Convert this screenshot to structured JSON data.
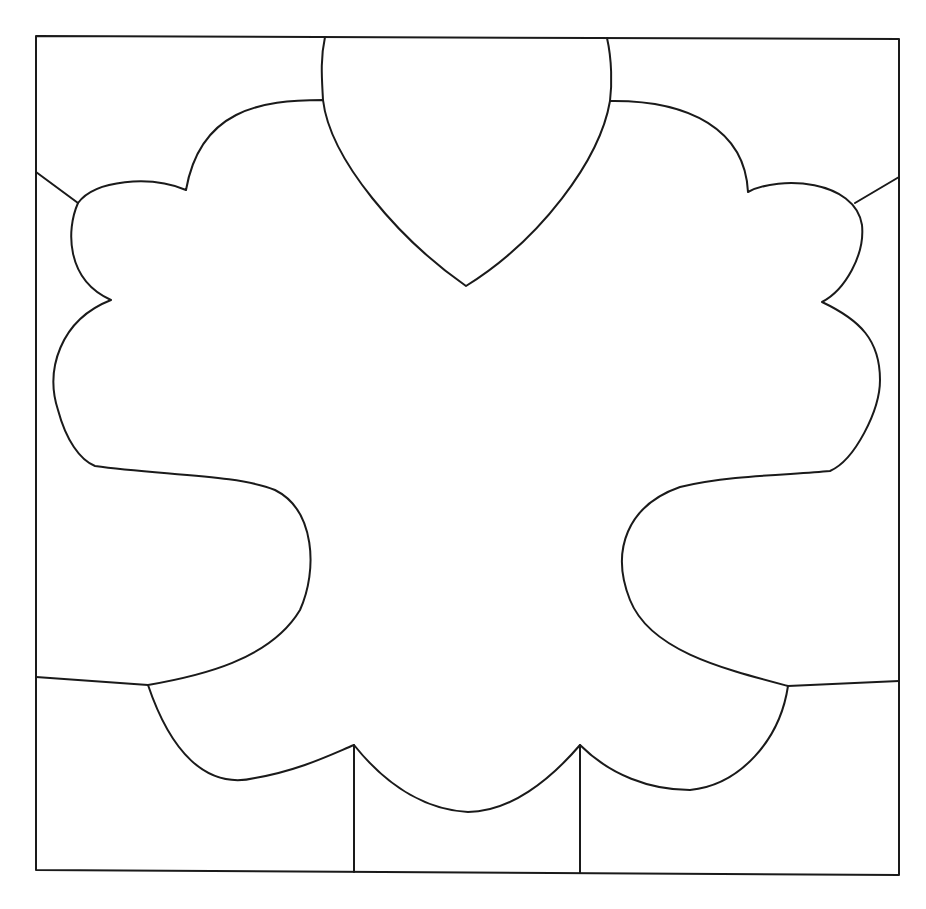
{
  "diagram": {
    "width": 926,
    "height": 909,
    "background": "#ffffff",
    "stroke_color": "#1a1a1a",
    "stroke_width": 2,
    "frame": {
      "path": "M36 36 L899 39 L899 875 L36 870 Z"
    },
    "central_shape": {
      "path": "M323 100 C260 100 200 110 186 190 C150 175 95 180 78 203 C66 230 66 280 111 300 C60 320 45 370 58 410 C66 440 80 460 95 466 C160 475 240 475 275 490 C315 510 318 570 300 610 C270 660 200 676 148 685 C170 750 205 790 255 778 C300 770 330 755 354 745 C390 790 430 810 468 812 C510 812 550 780 580 745 C610 775 650 790 690 790 C740 785 780 740 788 686 C720 668 650 650 630 600 C610 550 628 505 680 487 C730 475 790 475 830 471 C855 460 880 410 880 380 C880 340 860 320 822 302 C845 290 865 255 862 225 C855 180 780 175 748 192 C745 130 690 100 610 101 C600 160 540 240 466 286 C400 240 330 160 323 100 Z"
    },
    "partitions": [
      {
        "name": "top-left-divider",
        "path": "M325 37 C320 60 322 80 323 100"
      },
      {
        "name": "top-right-divider",
        "path": "M607 38 C612 60 612 85 610 101"
      },
      {
        "name": "upper-left-spoke",
        "path": "M36 172 L78 203"
      },
      {
        "name": "upper-right-spoke",
        "path": "M899 177 L855 203"
      },
      {
        "name": "lower-left-spoke",
        "path": "M36 677 L148 685"
      },
      {
        "name": "lower-right-spoke",
        "path": "M899 681 L788 686"
      },
      {
        "name": "bottom-left-divider",
        "path": "M354 745 L354 872"
      },
      {
        "name": "bottom-right-divider",
        "path": "M580 745 L580 873"
      }
    ]
  }
}
